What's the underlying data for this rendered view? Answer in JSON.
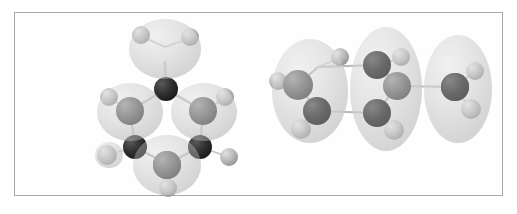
{
  "figure": {
    "kind": "molecular-orbital-illustration",
    "background_color": "#ffffff",
    "frame_border_color": "#a8a8a8",
    "frame": {
      "x": 14,
      "y": 12,
      "width": 489,
      "height": 184
    },
    "rendering_style": "grayscale ball-and-stick with translucent orbital isosurface",
    "caption": "",
    "labels": []
  },
  "palette": {
    "orbital_surface": "#d5d5d5",
    "orbital_surface_highlight": "#ececec",
    "orbital_surface_shadow": "#b0b0b0",
    "carbon_dark": "#2d2d2d",
    "carbon_mid": "#6e6e6e",
    "hydrogen": "#b5b5b5",
    "hydrogen_highlight": "#d8d8d8",
    "bond": "#bdbdbd"
  },
  "panels": [
    {
      "id": "left-panel",
      "name": "benzene-orbital-top-view",
      "view": "in-plane / top-down ring view",
      "molecule": "benzene",
      "ring_atoms": 6,
      "hydrogens": 6,
      "orbital_lobes": 4,
      "lobe_description": "four bulbous isosurface lobes enveloping alternating CH units of the ring",
      "atoms": [
        {
          "element": "C",
          "shade": "carbon_mid",
          "cx": 70,
          "cy": 34,
          "r": 13
        },
        {
          "element": "C",
          "shade": "carbon_dark",
          "cx": 71,
          "cy": 76,
          "r": 12
        },
        {
          "element": "C",
          "shade": "carbon_mid",
          "cx": 35,
          "cy": 98,
          "r": 14
        },
        {
          "element": "C",
          "shade": "carbon_mid",
          "cx": 108,
          "cy": 98,
          "r": 14
        },
        {
          "element": "C",
          "shade": "carbon_dark",
          "cx": 40,
          "cy": 134,
          "r": 12
        },
        {
          "element": "C",
          "shade": "carbon_dark",
          "cx": 105,
          "cy": 134,
          "r": 12
        },
        {
          "element": "C",
          "shade": "carbon_mid",
          "cx": 72,
          "cy": 152,
          "r": 14
        }
      ],
      "hydrogen_atoms": [
        {
          "cx": 46,
          "cy": 22,
          "r": 9
        },
        {
          "cx": 95,
          "cy": 24,
          "r": 9
        },
        {
          "cx": 14,
          "cy": 84,
          "r": 9
        },
        {
          "cx": 130,
          "cy": 84,
          "r": 9
        },
        {
          "cx": 12,
          "cy": 142,
          "r": 10
        },
        {
          "cx": 134,
          "cy": 144,
          "r": 9
        },
        {
          "cx": 73,
          "cy": 175,
          "r": 9
        }
      ]
    },
    {
      "id": "right-panel",
      "name": "benzene-orbital-edge-view",
      "view": "edge-on / side view of ring",
      "molecule": "benzene",
      "ring_atoms": 6,
      "hydrogens": 6,
      "orbital_lobes": 3,
      "lobe_description": "three tall vertically elongated isosurface lobes spanning the ring edge-on",
      "atoms": [
        {
          "element": "C",
          "shade": "carbon_dark",
          "cx": 48,
          "cy": 54,
          "r": 13
        },
        {
          "element": "C",
          "shade": "carbon_mid",
          "cx": 28,
          "cy": 72,
          "r": 15
        },
        {
          "element": "C",
          "shade": "carbon_dark",
          "cx": 47,
          "cy": 98,
          "r": 14
        },
        {
          "element": "C",
          "shade": "carbon_dark",
          "cx": 107,
          "cy": 52,
          "r": 14
        },
        {
          "element": "C",
          "shade": "carbon_mid",
          "cx": 127,
          "cy": 73,
          "r": 14
        },
        {
          "element": "C",
          "shade": "carbon_dark",
          "cx": 107,
          "cy": 100,
          "r": 14
        },
        {
          "element": "C",
          "shade": "carbon_dark",
          "cx": 185,
          "cy": 74,
          "r": 14
        }
      ],
      "hydrogen_atoms": [
        {
          "cx": 70,
          "cy": 44,
          "r": 9
        },
        {
          "cx": 8,
          "cy": 68,
          "r": 9
        },
        {
          "cx": 31,
          "cy": 116,
          "r": 10
        },
        {
          "cx": 131,
          "cy": 44,
          "r": 9
        },
        {
          "cx": 124,
          "cy": 117,
          "r": 10
        },
        {
          "cx": 205,
          "cy": 58,
          "r": 9
        },
        {
          "cx": 201,
          "cy": 96,
          "r": 10
        }
      ]
    }
  ]
}
